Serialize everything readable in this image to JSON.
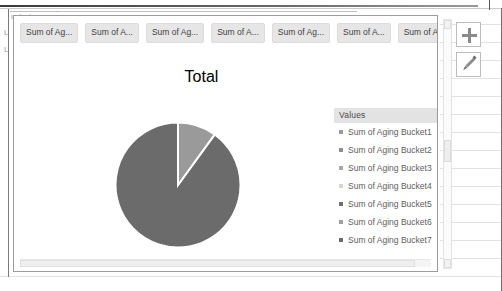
{
  "window": {
    "background_ghost_text": "uckets",
    "row_marks": [
      "L",
      "L"
    ]
  },
  "chart": {
    "title": "Total",
    "field_buttons": [
      {
        "label": "Sum of Ag..."
      },
      {
        "label": "Sum of A..."
      },
      {
        "label": "Sum of Ag..."
      },
      {
        "label": "Sum of A..."
      },
      {
        "label": "Sum of Ag..."
      },
      {
        "label": "Sum of A..."
      },
      {
        "label": "Sum of Ag..."
      }
    ],
    "legend": {
      "title": "Values",
      "position": "right"
    },
    "tools": [
      {
        "name": "chart-elements-button",
        "icon": "plus-icon",
        "label": "+"
      },
      {
        "name": "chart-styles-button",
        "icon": "paintbrush-icon",
        "label": ""
      }
    ],
    "scrollbars": {
      "horizontal": "horizontal-scrollbar",
      "vertical": "vertical-scrollbar"
    }
  },
  "chart_data": {
    "type": "pie",
    "title": "Total",
    "xlabel": "",
    "ylabel": "",
    "legend_title": "Values",
    "legend_position": "right",
    "grid": false,
    "categories": [
      "Sum of Aging Bucket1",
      "Sum of Aging Bucket2",
      "Sum of Aging Bucket3",
      "Sum of Aging Bucket4",
      "Sum of Aging Bucket5",
      "Sum of Aging Bucket6",
      "Sum of Aging Bucket7"
    ],
    "values": [
      10,
      0,
      0,
      0,
      0,
      0,
      90
    ],
    "slices": [
      {
        "label": "Sum of Aging Bucket1",
        "value": 10,
        "percent": 10,
        "color": "#9a9a9a",
        "start_angle": 0,
        "end_angle": 36
      },
      {
        "label": "Sum of Aging Bucket2",
        "value": 0,
        "percent": 0,
        "color": "#8f8f8f"
      },
      {
        "label": "Sum of Aging Bucket3",
        "value": 0,
        "percent": 0,
        "color": "#a8a8a8"
      },
      {
        "label": "Sum of Aging Bucket4",
        "value": 0,
        "percent": 0,
        "color": "#d6d6d6"
      },
      {
        "label": "Sum of Aging Bucket5",
        "value": 0,
        "percent": 0,
        "color": "#6f6f6f"
      },
      {
        "label": "Sum of Aging Bucket6",
        "value": 0,
        "percent": 0,
        "color": "#a0a0a0"
      },
      {
        "label": "Sum of Aging Bucket7",
        "value": 90,
        "percent": 90,
        "color": "#6b6b6b",
        "start_angle": 36,
        "end_angle": 360
      }
    ],
    "legend_swatch_colors": [
      "#9a9a9a",
      "#8f8f8f",
      "#a8a8a8",
      "#d6d6d6",
      "#6f6f6f",
      "#a0a0a0",
      "#6b6b6b"
    ]
  }
}
